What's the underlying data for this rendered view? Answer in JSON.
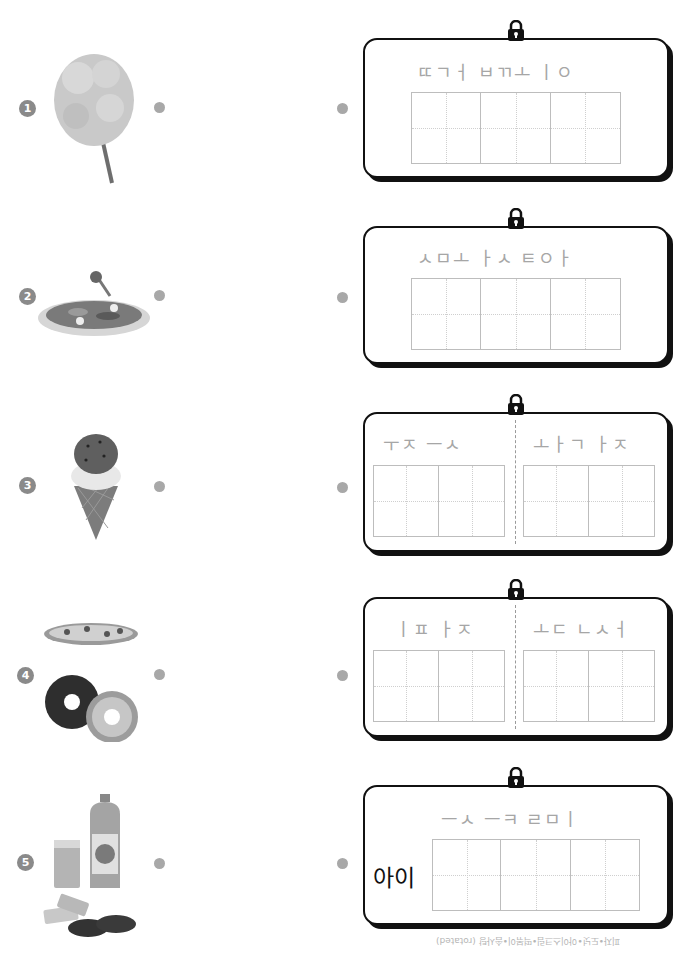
{
  "items": [
    {
      "number": "1",
      "image": "cotton-candy",
      "hint_top": "ㄸㄱㅓ ㅂㄲㅗ ㅣㅇ",
      "label": "",
      "grids": [
        3
      ]
    },
    {
      "number": "2",
      "image": "tteokbokki-plate",
      "hint_top": "ㅅㅁㅗ ㅏㅅ ㅌㅇㅏ",
      "label": "",
      "grids": [
        3
      ]
    },
    {
      "number": "3",
      "image": "ice-cream-cone",
      "hint_left": "ㅜㅈ ㅡㅅ",
      "hint_right": "ㅗㅏㄱ ㅏㅈ",
      "label": "",
      "grids": [
        2,
        2
      ]
    },
    {
      "number": "4",
      "image": "pizza-and-donuts",
      "hint_left": "ㅣㅍ ㅏㅈ",
      "hint_right": "ㅗㄷ ㄴㅅㅓ",
      "label": "",
      "grids": [
        2,
        2
      ]
    },
    {
      "number": "5",
      "image": "juice-and-cookies",
      "hint_top": "ㅡㅅ ㅡㅋ ㄹㅁㅣ",
      "label": "아이",
      "grids": [
        3
      ]
    }
  ],
  "footer": "피자•도넛•아이스크림•떡볶이•솜사탕 (rotated)",
  "colors": {
    "hint": "#a6a6a6",
    "badge": "#8a8a8a",
    "dot": "#a8a8a8",
    "border": "#111111",
    "grid": "#bdbdbd"
  }
}
